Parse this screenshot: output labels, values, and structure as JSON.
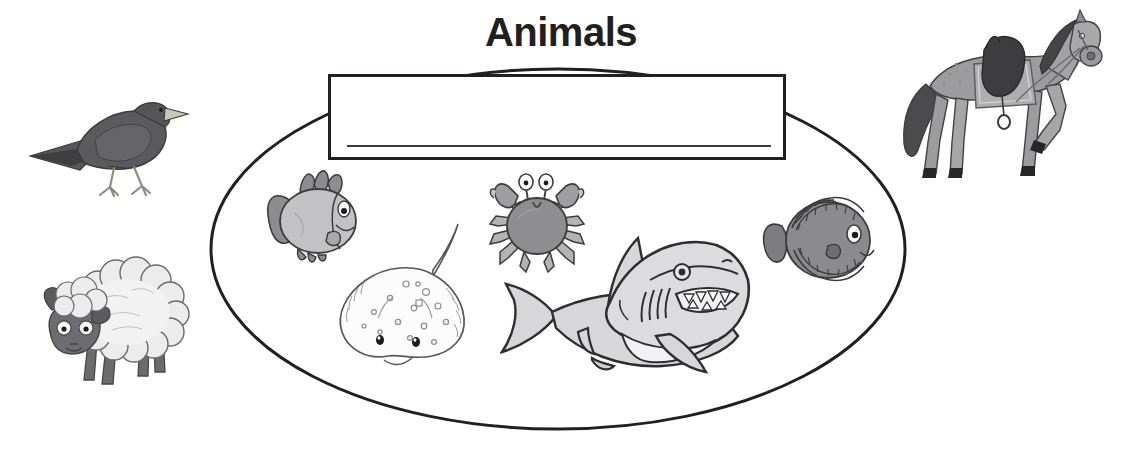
{
  "worksheet": {
    "title": "Animals",
    "background_color": "#ffffff",
    "ink_color": "#231f20",
    "width": 1122,
    "height": 452
  },
  "answer_field": {
    "value": "",
    "placeholder": "",
    "writing_line_label": "writing line"
  },
  "grouping": {
    "shape": "ellipse",
    "label": "sea animals group",
    "center_x": 558,
    "center_y": 249,
    "radius_x": 347,
    "radius_y": 180
  },
  "animals_inside": [
    {
      "name": "fish",
      "label": "Fish",
      "color": "#b9b9b9",
      "x": 250,
      "y": 165
    },
    {
      "name": "stingray",
      "label": "Stingray",
      "color": "#fbfbfb",
      "x": 330,
      "y": 230
    },
    {
      "name": "crab",
      "label": "Crab",
      "color": "#8f8f8f",
      "x": 483,
      "y": 168
    },
    {
      "name": "shark",
      "label": "Shark",
      "color": "#d8d8d8",
      "x": 503,
      "y": 228
    },
    {
      "name": "flat-fish",
      "label": "Flat fish",
      "color": "#8b8b8b",
      "x": 757,
      "y": 192
    }
  ],
  "animals_outside": [
    {
      "name": "bird",
      "label": "Bird",
      "color": "#5d5d5d",
      "x": 28,
      "y": 80
    },
    {
      "name": "sheep",
      "label": "Sheep",
      "color": "#e2e2e2",
      "x": 30,
      "y": 258
    },
    {
      "name": "horse",
      "label": "Horse",
      "color": "#9a9a9a",
      "x": 892,
      "y": 12
    }
  ]
}
